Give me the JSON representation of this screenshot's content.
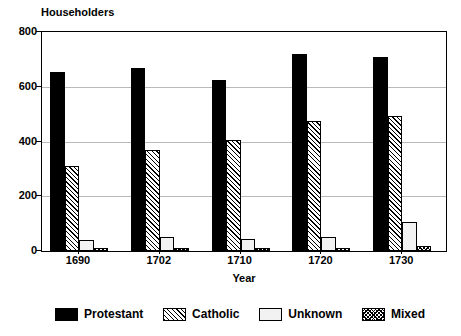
{
  "chart_data": {
    "type": "bar",
    "title": "",
    "ylabel": "Householders",
    "xlabel": "Year",
    "categories": [
      "1690",
      "1702",
      "1710",
      "1720",
      "1730"
    ],
    "ylim": [
      0,
      800
    ],
    "yticks": [
      0,
      200,
      400,
      600,
      800
    ],
    "ytick_labels": [
      "0",
      "200",
      "400",
      "600",
      "800"
    ],
    "grid": true,
    "legend_position": "bottom",
    "series": [
      {
        "name": "Protestant",
        "fill": "solid-black",
        "color": "#000000",
        "values": [
          655,
          670,
          625,
          720,
          710
        ]
      },
      {
        "name": "Catholic",
        "fill": "diagonal-hatch",
        "color": "#000000",
        "values": [
          310,
          370,
          405,
          475,
          495
        ]
      },
      {
        "name": "Unknown",
        "fill": "light-empty",
        "color": "#f2f2f2",
        "values": [
          40,
          50,
          45,
          50,
          105
        ]
      },
      {
        "name": "Mixed",
        "fill": "dense-crosshatch",
        "color": "#000000",
        "values": [
          10,
          10,
          10,
          10,
          18
        ]
      }
    ]
  }
}
